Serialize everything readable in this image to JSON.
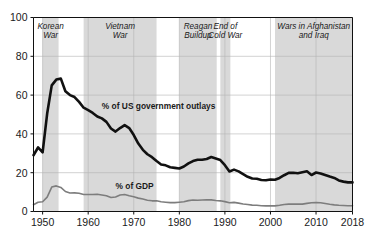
{
  "chart_data": {
    "type": "line",
    "title": "",
    "subtitle": "",
    "xlabel": "",
    "ylabel": "",
    "xlim": [
      1948,
      2018
    ],
    "ylim": [
      0,
      100
    ],
    "grid": true,
    "legend_position": "inline-annotation",
    "x_ticks": [
      "1950",
      "1960",
      "1970",
      "1980",
      "1990",
      "2000",
      "2010",
      "2018"
    ],
    "x_tick_values": [
      1950,
      1960,
      1970,
      1980,
      1990,
      2000,
      2010,
      2018
    ],
    "y_ticks": [
      "0",
      "20",
      "40",
      "60",
      "80",
      "100"
    ],
    "y_tick_values": [
      0,
      20,
      40,
      60,
      80,
      100
    ],
    "x": [
      1948,
      1949,
      1950,
      1951,
      1952,
      1953,
      1954,
      1955,
      1956,
      1957,
      1958,
      1959,
      1960,
      1961,
      1962,
      1963,
      1964,
      1965,
      1966,
      1967,
      1968,
      1969,
      1970,
      1971,
      1972,
      1973,
      1974,
      1975,
      1976,
      1977,
      1978,
      1979,
      1980,
      1981,
      1982,
      1983,
      1984,
      1985,
      1986,
      1987,
      1988,
      1989,
      1990,
      1991,
      1992,
      1993,
      1994,
      1995,
      1996,
      1997,
      1998,
      1999,
      2000,
      2001,
      2002,
      2003,
      2004,
      2005,
      2006,
      2007,
      2008,
      2009,
      2010,
      2011,
      2012,
      2013,
      2014,
      2015,
      2016,
      2017,
      2018
    ],
    "series": [
      {
        "name": "% of US government outlays",
        "color": "#111111",
        "width": 2.6,
        "label_x": 1963,
        "label_y": 53,
        "values": [
          29.0,
          33.0,
          30.5,
          50.5,
          65.0,
          68.0,
          68.5,
          62.0,
          60.0,
          59.0,
          56.5,
          53.5,
          52.2,
          50.8,
          49.0,
          48.0,
          46.2,
          42.8,
          41.2,
          43.0,
          44.5,
          43.0,
          39.4,
          35.0,
          31.8,
          29.5,
          28.0,
          26.0,
          24.2,
          23.8,
          22.8,
          22.5,
          22.2,
          23.2,
          24.8,
          26.0,
          26.7,
          26.7,
          27.1,
          28.1,
          27.3,
          26.5,
          23.9,
          20.6,
          21.6,
          20.7,
          19.3,
          17.9,
          17.0,
          16.9,
          16.2,
          16.1,
          16.5,
          16.4,
          17.3,
          18.7,
          19.9,
          20.0,
          19.7,
          20.2,
          20.7,
          18.8,
          20.1,
          19.6,
          18.8,
          18.0,
          17.3,
          16.0,
          15.4,
          15.0,
          15.0
        ]
      },
      {
        "name": "% of GDP",
        "color": "#7d7d7d",
        "width": 1.6,
        "label_x": 1966,
        "label_y": 11.6,
        "values": [
          3.5,
          4.8,
          5.0,
          7.4,
          12.6,
          13.2,
          12.4,
          10.3,
          9.5,
          9.6,
          9.4,
          8.8,
          8.8,
          8.8,
          8.9,
          8.5,
          8.1,
          7.2,
          7.5,
          8.5,
          8.8,
          8.1,
          7.6,
          6.9,
          6.4,
          5.8,
          5.5,
          5.5,
          5.0,
          4.8,
          4.6,
          4.6,
          4.8,
          5.0,
          5.6,
          5.9,
          5.8,
          5.9,
          6.0,
          6.0,
          5.7,
          5.5,
          5.1,
          4.5,
          4.7,
          4.3,
          3.9,
          3.6,
          3.3,
          3.2,
          3.0,
          2.9,
          2.9,
          2.9,
          3.2,
          3.6,
          3.8,
          3.8,
          3.8,
          3.8,
          4.2,
          4.5,
          4.6,
          4.5,
          4.1,
          3.7,
          3.4,
          3.2,
          3.1,
          3.0,
          3.0
        ]
      }
    ],
    "shaded_bands": [
      {
        "label": "Korean\nWar",
        "label_lines": [
          "Korean",
          "War"
        ],
        "start": 1950,
        "end": 1953.5,
        "color": "#d9d9d9"
      },
      {
        "label": "Vietnam\nWar",
        "label_lines": [
          "Vietnam",
          "War"
        ],
        "start": 1959,
        "end": 1975,
        "color": "#d9d9d9"
      },
      {
        "label": "Reagan\nBuildup",
        "label_lines": [
          "Reagan",
          "Buildup"
        ],
        "start": 1980,
        "end": 1988.2,
        "color": "#d9d9d9"
      },
      {
        "label": "End of\nCold War",
        "label_lines": [
          "End of",
          "Cold War"
        ],
        "start": 1989,
        "end": 1991.2,
        "color": "#d9d9d9"
      },
      {
        "label": "Wars in Afghanistan\nand Iraq",
        "label_lines": [
          "Wars in Afghanistan",
          "and Iraq"
        ],
        "start": 2001,
        "end": 2018,
        "color": "#d9d9d9"
      }
    ],
    "annotations": [
      {
        "text": "% of US government outlays",
        "x": 1963,
        "y": 53
      },
      {
        "text": "% of GDP",
        "x": 1966,
        "y": 11.6
      }
    ]
  },
  "axes": {
    "axis_color": "#111111",
    "grid_color": "#b4b4b4"
  }
}
